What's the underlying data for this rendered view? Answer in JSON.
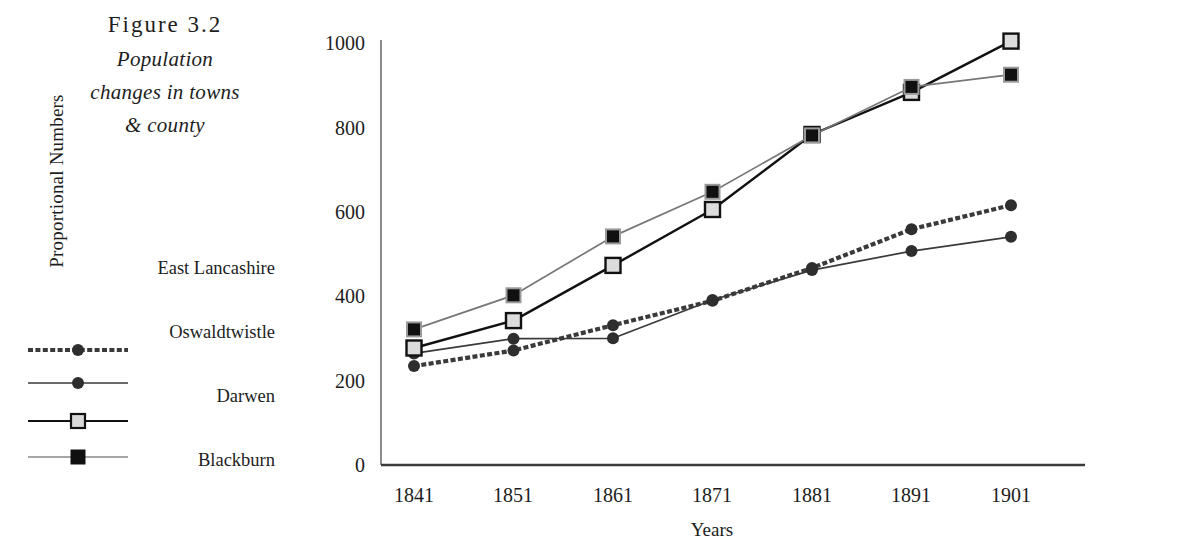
{
  "figure": {
    "number_label": "Figure 3.2",
    "title_line1": "Population",
    "title_line2": "changes in towns",
    "title_line3": "& county"
  },
  "legend": {
    "items": [
      {
        "label": "East Lancashire",
        "marker": "filled-circle",
        "line": "dotted-thick",
        "color": "#3a3a3a"
      },
      {
        "label": "Oswaldtwistle",
        "marker": "filled-circle",
        "line": "solid-thin",
        "color": "#3a3a3a"
      },
      {
        "label": "Darwen",
        "marker": "open-square",
        "line": "solid-thick",
        "color": "#111111"
      },
      {
        "label": "Blackburn",
        "marker": "filled-square",
        "line": "solid-thin",
        "color": "#777777"
      }
    ]
  },
  "axes": {
    "ylabel": "Proportional Numbers",
    "xlabel": "Years",
    "yticks": [
      "0",
      "200",
      "400",
      "600",
      "800",
      "1000"
    ],
    "xticks": [
      "1841",
      "1851",
      "1861",
      "1871",
      "1881",
      "1891",
      "1901"
    ]
  },
  "chart_data": {
    "type": "line",
    "title": "Population changes in towns & county",
    "xlabel": "Years",
    "ylabel": "Proportional Numbers",
    "categories": [
      "1841",
      "1851",
      "1861",
      "1871",
      "1881",
      "1891",
      "1901"
    ],
    "x": [
      1841,
      1851,
      1861,
      1871,
      1881,
      1891,
      1901
    ],
    "ylim": [
      0,
      1000
    ],
    "yticks": [
      0,
      200,
      400,
      600,
      800,
      1000
    ],
    "grid": false,
    "legend_position": "left",
    "series": [
      {
        "name": "East Lancashire",
        "marker": "filled-circle",
        "line": "dotted-thick",
        "color": "#3a3a3a",
        "values": [
          235,
          272,
          332,
          390,
          468,
          560,
          617
        ]
      },
      {
        "name": "Oswaldtwistle",
        "marker": "filled-circle",
        "line": "solid-thin",
        "color": "#3a3a3a",
        "values": [
          265,
          300,
          301,
          392,
          463,
          508,
          542
        ]
      },
      {
        "name": "Darwen",
        "marker": "open-square",
        "line": "solid-thick",
        "color": "#111111",
        "values": [
          278,
          343,
          474,
          607,
          785,
          885,
          1007
        ]
      },
      {
        "name": "Blackburn",
        "marker": "filled-square",
        "line": "solid-thin",
        "color": "#777777",
        "values": [
          322,
          403,
          543,
          649,
          783,
          898,
          927
        ]
      }
    ]
  }
}
